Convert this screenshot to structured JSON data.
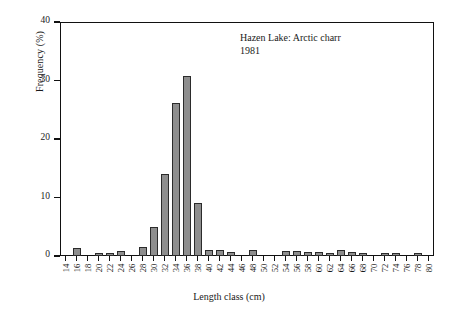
{
  "chart_data": {
    "type": "bar",
    "title": "Hazen Lake: Arctic charr",
    "subtitle": "1981",
    "xlabel": "Length class (cm)",
    "ylabel": "Frequency (%)",
    "xlim": [
      13,
      81
    ],
    "ylim": [
      0,
      40
    ],
    "yticks": [
      0,
      10,
      20,
      30,
      40
    ],
    "ytick_labels": [
      "0",
      "10",
      "20",
      "30",
      "40"
    ],
    "grid": false,
    "legend": null,
    "bar_color": "#8e8e8e",
    "bar_edge_color": "#2b2b2b",
    "categories": [
      14,
      16,
      18,
      20,
      22,
      24,
      26,
      28,
      30,
      32,
      34,
      36,
      38,
      40,
      42,
      44,
      46,
      48,
      50,
      52,
      54,
      56,
      58,
      60,
      62,
      64,
      66,
      68,
      70,
      72,
      74,
      76,
      78,
      80
    ],
    "category_labels": [
      "14",
      "16",
      "18",
      "20",
      "22",
      "24",
      "26",
      "28",
      "30",
      "32",
      "34",
      "36",
      "38",
      "40",
      "42",
      "44",
      "46",
      "48",
      "50",
      "52",
      "54",
      "56",
      "58",
      "60",
      "62",
      "64",
      "66",
      "68",
      "70",
      "72",
      "74",
      "76",
      "78",
      "80"
    ],
    "values": [
      0,
      1.3,
      0,
      0.5,
      0.2,
      0.9,
      0,
      1.6,
      5.0,
      14.1,
      26.2,
      30.8,
      9.0,
      1.1,
      1.1,
      0.6,
      0,
      1.1,
      0,
      0,
      0.9,
      0.9,
      0.6,
      0.6,
      0.2,
      1.1,
      0.6,
      0.2,
      0,
      0.2,
      0.2,
      0,
      0.2,
      0
    ]
  }
}
